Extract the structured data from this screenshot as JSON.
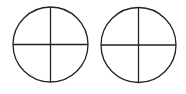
{
  "diagram": {
    "shapes": [
      {
        "type": "circle-quartered",
        "label": "",
        "divisions": 4
      },
      {
        "type": "circle-quartered",
        "label": "",
        "divisions": 4
      }
    ],
    "stroke_color": "#222222",
    "background_color": "#ffffff"
  }
}
